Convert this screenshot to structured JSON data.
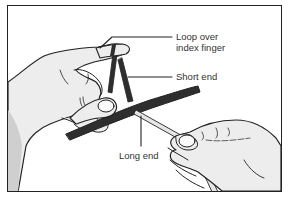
{
  "figure": {
    "labels": {
      "loop": [
        "Loop over",
        "index finger"
      ],
      "short_end": "Short end",
      "long_end": "Long end"
    },
    "colors": {
      "outline": "#222222",
      "skin": "#eeeeee",
      "skin_shadow": "#d4d4d4",
      "dark_rope": "#2e2e2e",
      "light_rope": "#e6e6e6",
      "label_text": "#333333"
    }
  }
}
